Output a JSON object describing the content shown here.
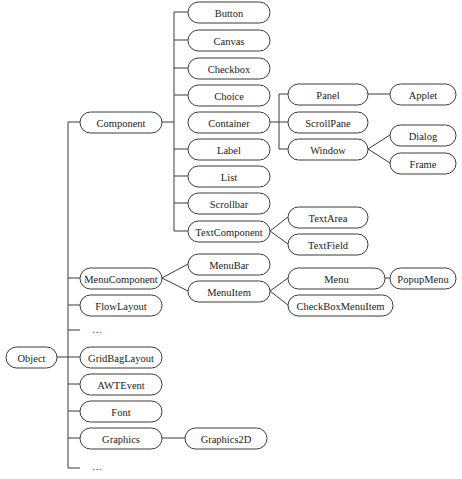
{
  "diagram": {
    "nodes": [
      {
        "id": "object",
        "label": "Object",
        "x": 6,
        "y": 347,
        "w": 51,
        "h": 21
      },
      {
        "id": "component",
        "label": "Component",
        "x": 80,
        "y": 112,
        "w": 82,
        "h": 21
      },
      {
        "id": "button",
        "label": "Button",
        "x": 188,
        "y": 2,
        "w": 82,
        "h": 21
      },
      {
        "id": "canvas",
        "label": "Canvas",
        "x": 188,
        "y": 30,
        "w": 82,
        "h": 21
      },
      {
        "id": "checkbox",
        "label": "Checkbox",
        "x": 188,
        "y": 58,
        "w": 82,
        "h": 21
      },
      {
        "id": "choice",
        "label": "Choice",
        "x": 188,
        "y": 85,
        "w": 82,
        "h": 21
      },
      {
        "id": "container",
        "label": "Container",
        "x": 188,
        "y": 112,
        "w": 82,
        "h": 21
      },
      {
        "id": "label",
        "label": "Label",
        "x": 188,
        "y": 139,
        "w": 82,
        "h": 21
      },
      {
        "id": "list",
        "label": "List",
        "x": 188,
        "y": 166,
        "w": 82,
        "h": 21
      },
      {
        "id": "scrollbar",
        "label": "Scrollbar",
        "x": 188,
        "y": 193,
        "w": 82,
        "h": 21
      },
      {
        "id": "textcomponent",
        "label": "TextComponent",
        "x": 188,
        "y": 221,
        "w": 82,
        "h": 21
      },
      {
        "id": "panel",
        "label": "Panel",
        "x": 288,
        "y": 84,
        "w": 80,
        "h": 21
      },
      {
        "id": "scrollpane",
        "label": "ScrollPane",
        "x": 288,
        "y": 112,
        "w": 80,
        "h": 21
      },
      {
        "id": "window",
        "label": "Window",
        "x": 288,
        "y": 139,
        "w": 80,
        "h": 21
      },
      {
        "id": "applet",
        "label": "Applet",
        "x": 390,
        "y": 84,
        "w": 66,
        "h": 21
      },
      {
        "id": "dialog",
        "label": "Dialog",
        "x": 390,
        "y": 125,
        "w": 66,
        "h": 21
      },
      {
        "id": "frame",
        "label": "Frame",
        "x": 390,
        "y": 153,
        "w": 66,
        "h": 21
      },
      {
        "id": "textarea",
        "label": "TextArea",
        "x": 288,
        "y": 207,
        "w": 80,
        "h": 21
      },
      {
        "id": "textfield",
        "label": "TextField",
        "x": 288,
        "y": 234,
        "w": 80,
        "h": 21
      },
      {
        "id": "menucomponent",
        "label": "MenuComponent",
        "x": 80,
        "y": 268,
        "w": 82,
        "h": 21
      },
      {
        "id": "menubar",
        "label": "MenuBar",
        "x": 188,
        "y": 254,
        "w": 82,
        "h": 21
      },
      {
        "id": "menuitem",
        "label": "MenuItem",
        "x": 188,
        "y": 281,
        "w": 82,
        "h": 21
      },
      {
        "id": "menu",
        "label": "Menu",
        "x": 288,
        "y": 268,
        "w": 97,
        "h": 21
      },
      {
        "id": "checkboxmenuitem",
        "label": "CheckBoxMenuItem",
        "x": 288,
        "y": 295,
        "w": 105,
        "h": 21
      },
      {
        "id": "popupmenu",
        "label": "PopupMenu",
        "x": 390,
        "y": 268,
        "w": 66,
        "h": 21
      },
      {
        "id": "flowlayout",
        "label": "FlowLayout",
        "x": 80,
        "y": 295,
        "w": 82,
        "h": 21
      },
      {
        "id": "gridbaglayout",
        "label": "GridBagLayout",
        "x": 80,
        "y": 347,
        "w": 82,
        "h": 21
      },
      {
        "id": "awtevent",
        "label": "AWTEvent",
        "x": 80,
        "y": 374,
        "w": 82,
        "h": 21
      },
      {
        "id": "font",
        "label": "Font",
        "x": 80,
        "y": 401,
        "w": 82,
        "h": 21
      },
      {
        "id": "graphics",
        "label": "Graphics",
        "x": 80,
        "y": 428,
        "w": 82,
        "h": 21
      },
      {
        "id": "graphics2d",
        "label": "Graphics2D",
        "x": 185,
        "y": 428,
        "w": 82,
        "h": 21
      }
    ],
    "ellipses": [
      {
        "label": "…",
        "x": 92,
        "y": 333
      },
      {
        "label": "…",
        "x": 92,
        "y": 470
      }
    ]
  }
}
